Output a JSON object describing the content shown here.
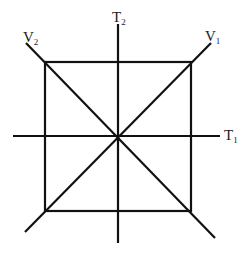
{
  "diagram": {
    "type": "axes-square-diagram",
    "stroke_color": "#111111",
    "background": "#ffffff",
    "square": {
      "x1": 45,
      "y1": 62,
      "x2": 191,
      "y2": 211
    },
    "center": {
      "x": 118,
      "y": 136
    },
    "axes": [
      {
        "id": "T1",
        "orientation": "horizontal",
        "from": [
          13,
          136
        ],
        "to": [
          220,
          136
        ]
      },
      {
        "id": "T2",
        "orientation": "vertical",
        "from": [
          118,
          24
        ],
        "to": [
          118,
          243
        ]
      },
      {
        "id": "V1",
        "orientation": "diagonal",
        "from": [
          25,
          232
        ],
        "to": [
          211,
          43
        ]
      },
      {
        "id": "V2",
        "orientation": "diagonal",
        "from": [
          26,
          43
        ],
        "to": [
          215,
          238
        ]
      }
    ],
    "labels": {
      "T1": {
        "main": "T",
        "sub": "1"
      },
      "T2": {
        "main": "T",
        "sub": "2"
      },
      "V1": {
        "main": "V",
        "sub": "1"
      },
      "V2": {
        "main": "V",
        "sub": "2"
      }
    }
  }
}
